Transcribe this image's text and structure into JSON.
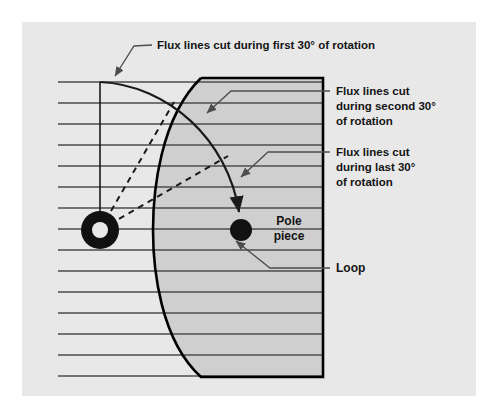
{
  "figure": {
    "background_color": "#ffffff",
    "panel_color": "#e8e8e8",
    "pole_piece_color": "#cfcfcf",
    "line_color": "#4d4d4d",
    "outline_color": "#000000",
    "label_color": "#141414"
  },
  "labels": {
    "first_30": {
      "name": "flux-lines-first-30",
      "lines": [
        "Flux lines cut during first 30° of rotation"
      ],
      "text": "Flux lines cut during first 30° of rotation"
    },
    "second_30": {
      "name": "flux-lines-second-30",
      "lines": [
        "Flux lines cut",
        "during second 30°",
        "of rotation"
      ]
    },
    "last_30": {
      "name": "flux-lines-last-30",
      "lines": [
        "Flux lines cut",
        "during last 30°",
        "of rotation"
      ]
    },
    "pole_piece": {
      "name": "pole-piece",
      "lines": [
        "Pole",
        "piece"
      ]
    },
    "loop": {
      "name": "loop",
      "lines": [
        "Loop"
      ]
    }
  },
  "diagram": {
    "flux_lines": {
      "count": 15,
      "y_positions": [
        82,
        103,
        124,
        145,
        166,
        187,
        208,
        229,
        250,
        271,
        292,
        313,
        334,
        355,
        376
      ],
      "x_start": 58,
      "spacing": 21
    },
    "pole_piece_shape": {
      "top_y": 78,
      "bottom_y": 377,
      "right_x": 323,
      "arc_apex_x": 160,
      "arc_top_x": 201,
      "arc_bottom_x": 201
    },
    "loop_start": {
      "label": "loop-ring",
      "cx": 100,
      "cy": 230,
      "outer_r": 19,
      "inner_r": 8,
      "style": "annulus"
    },
    "loop_end": {
      "label": "loop-dot",
      "cx": 241,
      "cy": 230,
      "r": 11,
      "style": "filled"
    },
    "rotation_radii": [
      {
        "degrees": 60,
        "dashed": true
      },
      {
        "degrees": 30,
        "dashed": true
      }
    ],
    "vertical_radius": {
      "from_y": 82,
      "to_y": 230,
      "x": 100
    },
    "sweep_arc": {
      "from": [
        100,
        82
      ],
      "to": [
        241,
        230
      ],
      "arrow_at_end": true
    }
  }
}
